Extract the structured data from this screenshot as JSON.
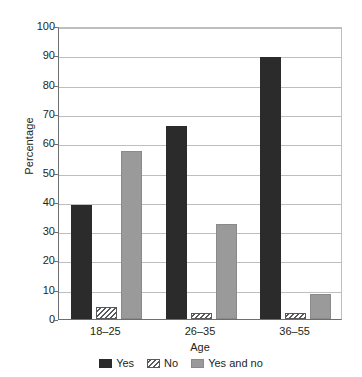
{
  "chart_data": {
    "type": "bar",
    "title": "",
    "subtitle": "",
    "xlabel": "Age",
    "ylabel": "Percentage",
    "categories": [
      "18–25",
      "26–35",
      "36–55"
    ],
    "series": [
      {
        "name": "Yes",
        "values": [
          39,
          66,
          89.5
        ],
        "color": "#2b2b2b",
        "fill": "solid"
      },
      {
        "name": "No",
        "values": [
          4,
          2,
          2
        ],
        "color": "#58595b",
        "fill": "hatched"
      },
      {
        "name": "Yes and no",
        "values": [
          57.5,
          32.5,
          8.5
        ],
        "color": "#9a9a9a",
        "fill": "solid"
      }
    ],
    "ylim": [
      0,
      100
    ],
    "yticks": [
      0,
      10,
      20,
      30,
      40,
      50,
      60,
      70,
      80,
      90,
      100
    ],
    "ytick_labels": [
      "0",
      "10",
      "20",
      "30",
      "40",
      "50",
      "60",
      "70",
      "80",
      "90",
      "100"
    ],
    "grid": true,
    "grid_axis": "y",
    "legend_position": "bottom-center",
    "background": "#ffffff"
  }
}
